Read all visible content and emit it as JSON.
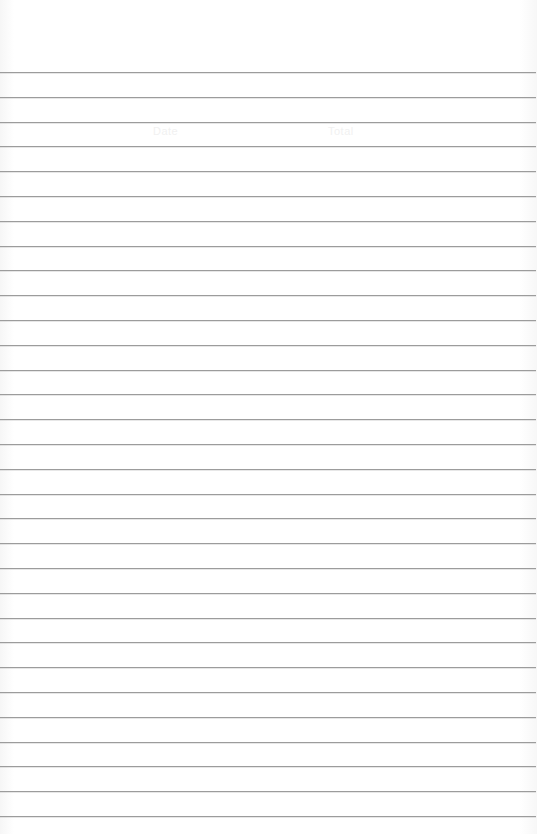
{
  "page": {
    "type": "ruled-paper",
    "background_color": "#ffffff",
    "rule_color": "#9c9c9c",
    "rule_count": 31,
    "first_rule_y": 72,
    "rule_spacing": 24.8
  },
  "ghost_text": [
    {
      "text": "Date",
      "x": 153,
      "y": 125
    },
    {
      "text": "Total",
      "x": 328,
      "y": 125
    }
  ]
}
